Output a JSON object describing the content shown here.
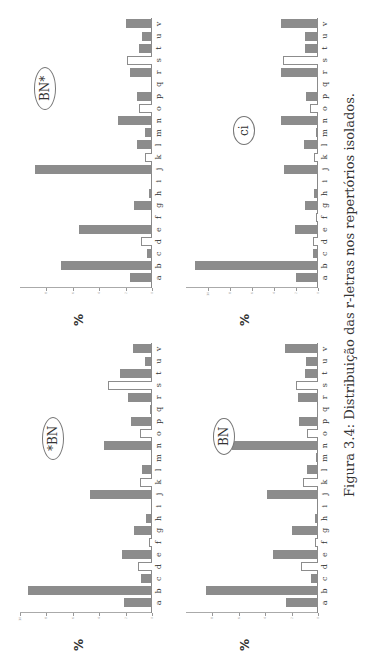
{
  "caption": "Figura 3.4: Distribuição das r-letras nos repertórios isolados.",
  "y_axis_label": "%",
  "categories": [
    "a",
    "b",
    "c",
    "d",
    "e",
    "f",
    "g",
    "h",
    "i",
    "j",
    "k",
    "l",
    "m",
    "n",
    "o",
    "p",
    "q",
    "r",
    "s",
    "t",
    "u",
    "v"
  ],
  "open_bar_categories": [
    "d",
    "f",
    "k",
    "o",
    "s"
  ],
  "colors": {
    "filled_bar": "#8c8c8c",
    "open_bar_fill": "#ffffff",
    "axis": "#888888"
  },
  "chart_data": [
    {
      "type": "bar",
      "title": "*BN",
      "position": "top-left",
      "xlabel": "",
      "ylabel": "%",
      "ylim": [
        0,
        10
      ],
      "yticks": [
        0,
        2,
        4,
        6,
        8,
        10
      ],
      "categories": [
        "a",
        "b",
        "c",
        "d",
        "e",
        "f",
        "g",
        "h",
        "i",
        "j",
        "k",
        "l",
        "m",
        "n",
        "o",
        "p",
        "q",
        "r",
        "s",
        "t",
        "u",
        "v"
      ],
      "values": [
        2.1,
        9.4,
        0.8,
        1.05,
        2.3,
        0.25,
        1.35,
        0.45,
        0.0,
        4.7,
        0.9,
        0.75,
        0.05,
        3.6,
        0.9,
        1.6,
        0.15,
        1.8,
        3.3,
        2.4,
        0.5,
        1.45
      ],
      "grid": false
    },
    {
      "type": "bar",
      "title": "BN*",
      "position": "top-right",
      "xlabel": "",
      "ylabel": "%",
      "ylim": [
        0,
        10
      ],
      "yticks": [
        0,
        2,
        4,
        6,
        8
      ],
      "categories": [
        "a",
        "b",
        "c",
        "d",
        "e",
        "f",
        "g",
        "h",
        "i",
        "j",
        "k",
        "l",
        "m",
        "n",
        "o",
        "p",
        "q",
        "r",
        "s",
        "t",
        "u",
        "v"
      ],
      "values": [
        1.7,
        6.9,
        0.35,
        0.8,
        5.5,
        0.1,
        1.4,
        0.2,
        0.0,
        8.9,
        0.55,
        1.1,
        0.55,
        2.6,
        1.0,
        1.1,
        0.0,
        1.7,
        1.9,
        1.0,
        0.75,
        2.0
      ],
      "grid": false
    },
    {
      "type": "bar",
      "title": "BN",
      "position": "bottom-left",
      "xlabel": "",
      "ylabel": "%",
      "ylim": [
        0,
        10
      ],
      "yticks": [
        0,
        2,
        4,
        6,
        8
      ],
      "categories": [
        "a",
        "b",
        "c",
        "d",
        "e",
        "f",
        "g",
        "h",
        "i",
        "j",
        "k",
        "l",
        "m",
        "n",
        "o",
        "p",
        "q",
        "r",
        "s",
        "t",
        "u",
        "v"
      ],
      "values": [
        2.4,
        8.5,
        0.5,
        1.3,
        3.4,
        0.2,
        2.0,
        0.25,
        0.0,
        3.85,
        1.15,
        0.8,
        0.15,
        6.55,
        0.8,
        1.45,
        0.1,
        1.5,
        1.7,
        0.95,
        0.9,
        2.5
      ],
      "grid": false
    },
    {
      "type": "bar",
      "title": "ci",
      "position": "bottom-right",
      "xlabel": "",
      "ylabel": "%",
      "ylim": [
        0,
        12
      ],
      "yticks": [
        0,
        2,
        4,
        6,
        8,
        10
      ],
      "categories": [
        "a",
        "b",
        "c",
        "d",
        "e",
        "f",
        "g",
        "h",
        "i",
        "j",
        "k",
        "l",
        "m",
        "n",
        "o",
        "p",
        "q",
        "r",
        "s",
        "t",
        "u",
        "v"
      ],
      "values": [
        2.0,
        11.2,
        0.5,
        0.5,
        2.1,
        0.15,
        1.2,
        0.4,
        0.0,
        3.1,
        0.35,
        1.3,
        0.15,
        3.35,
        0.7,
        1.1,
        0.1,
        3.4,
        3.2,
        1.15,
        1.15,
        3.4
      ],
      "grid": false
    }
  ]
}
